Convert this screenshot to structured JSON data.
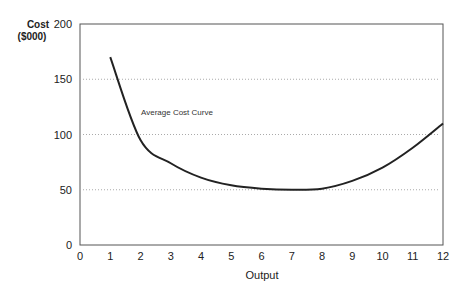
{
  "chart_data": {
    "type": "line",
    "title": "",
    "xlabel": "Output",
    "ylabel_line1": "Cost",
    "ylabel_line2": "($000)",
    "xlim": [
      0,
      12
    ],
    "ylim": [
      0,
      200
    ],
    "x_ticks": [
      "0",
      "1",
      "2",
      "3",
      "4",
      "5",
      "6",
      "7",
      "8",
      "9",
      "10",
      "11",
      "12"
    ],
    "y_ticks": [
      "0",
      "50",
      "100",
      "150",
      "200"
    ],
    "grid": "dotted horizontal at 50, 100, 150",
    "annotation": "Average Cost Curve",
    "series": [
      {
        "name": "Average Cost Curve",
        "x": [
          1,
          2,
          3,
          4,
          5,
          6,
          7,
          8,
          9,
          10,
          11,
          12
        ],
        "values": [
          170,
          95,
          74,
          61,
          54,
          51,
          50,
          51,
          58,
          70,
          88,
          110
        ]
      }
    ],
    "colors": {
      "line": "#222222",
      "axis": "#555555",
      "grid": "#aaaaaa"
    }
  }
}
